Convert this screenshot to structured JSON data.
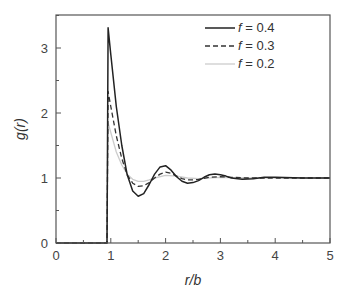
{
  "chart_data": {
    "type": "line",
    "title": "",
    "xlabel": "r/b",
    "ylabel": "g(r)",
    "xlim": [
      0,
      5
    ],
    "ylim": [
      0,
      3.5
    ],
    "x_ticks": [
      "0",
      "1",
      "2",
      "3",
      "4",
      "5"
    ],
    "y_ticks": [
      "0",
      "1",
      "2",
      "3"
    ],
    "grid": false,
    "legend_position": "upper right",
    "series": [
      {
        "name": "f = 0.4",
        "style": "solid",
        "color": "#222222",
        "x": [
          0,
          0.93,
          0.95,
          1.0,
          1.1,
          1.2,
          1.3,
          1.4,
          1.5,
          1.6,
          1.7,
          1.8,
          1.9,
          2.0,
          2.1,
          2.2,
          2.3,
          2.4,
          2.5,
          2.6,
          2.7,
          2.8,
          2.9,
          3.0,
          3.1,
          3.2,
          3.4,
          3.6,
          3.8,
          4.0,
          4.5,
          5.0
        ],
        "y": [
          0,
          0,
          3.31,
          2.9,
          2.1,
          1.5,
          1.05,
          0.8,
          0.72,
          0.76,
          0.9,
          1.06,
          1.17,
          1.19,
          1.12,
          1.02,
          0.95,
          0.92,
          0.93,
          0.96,
          1.01,
          1.05,
          1.06,
          1.05,
          1.03,
          1.0,
          0.98,
          0.99,
          1.01,
          1.01,
          1.0,
          1.0
        ]
      },
      {
        "name": "f = 0.3",
        "style": "dashed",
        "color": "#333333",
        "x": [
          0,
          0.93,
          0.95,
          1.0,
          1.1,
          1.2,
          1.3,
          1.4,
          1.5,
          1.6,
          1.7,
          1.8,
          1.9,
          2.0,
          2.1,
          2.2,
          2.3,
          2.4,
          2.5,
          2.6,
          2.8,
          3.0,
          3.2,
          3.5,
          4.0,
          4.5,
          5.0
        ],
        "y": [
          0,
          0,
          2.33,
          2.1,
          1.65,
          1.3,
          1.05,
          0.92,
          0.87,
          0.88,
          0.93,
          1.0,
          1.06,
          1.09,
          1.07,
          1.03,
          0.99,
          0.97,
          0.97,
          0.98,
          1.01,
          1.02,
          1.01,
          1.0,
          1.0,
          1.0,
          1.0
        ]
      },
      {
        "name": "f = 0.2",
        "style": "solid-light",
        "color": "#cccccc",
        "x": [
          0,
          0.93,
          0.95,
          1.0,
          1.1,
          1.2,
          1.3,
          1.4,
          1.5,
          1.6,
          1.7,
          1.8,
          2.0,
          2.2,
          2.4,
          2.6,
          3.0,
          3.5,
          4.0,
          5.0
        ],
        "y": [
          0,
          0,
          1.85,
          1.7,
          1.4,
          1.2,
          1.06,
          0.98,
          0.95,
          0.95,
          0.97,
          1.0,
          1.04,
          1.03,
          1.0,
          0.99,
          1.01,
          1.0,
          1.0,
          1.0
        ]
      }
    ]
  }
}
